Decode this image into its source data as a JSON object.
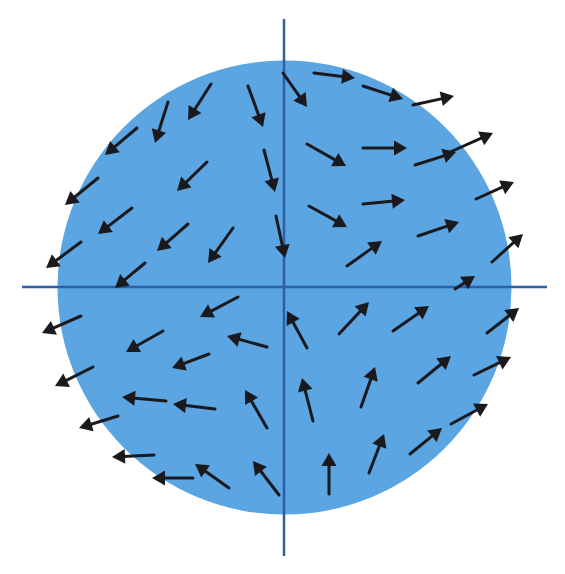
{
  "diagram": {
    "type": "vector-field",
    "colors": {
      "background": "#ffffff",
      "disk_fill": "#5aa5e2",
      "axis": "#2c5fa6",
      "arrow": "#1a1a1e"
    },
    "disk": {
      "cx": 284.5,
      "cy": 287.5,
      "r": 227
    },
    "axes": {
      "horizontal": {
        "x1": 22,
        "y1": 287,
        "x2": 547,
        "y2": 287
      },
      "vertical": {
        "x1": 284,
        "y1": 19,
        "x2": 284,
        "y2": 556
      }
    },
    "arrows": [
      [
        211,
        84,
        188,
        120
      ],
      [
        168,
        102,
        155,
        143
      ],
      [
        137,
        128,
        105,
        155
      ],
      [
        248,
        86,
        263,
        127
      ],
      [
        264,
        150,
        275,
        192
      ],
      [
        207,
        162,
        177,
        191
      ],
      [
        98,
        178,
        65,
        205
      ],
      [
        132,
        208,
        98,
        234
      ],
      [
        188,
        224,
        157,
        251
      ],
      [
        233,
        228,
        208,
        263
      ],
      [
        276,
        216,
        285,
        258
      ],
      [
        81,
        242,
        46,
        268
      ],
      [
        145,
        263,
        115,
        288
      ],
      [
        283,
        73,
        307,
        107
      ],
      [
        314,
        73,
        355,
        78
      ],
      [
        363,
        86,
        403,
        99
      ],
      [
        413,
        105,
        454,
        96
      ],
      [
        307,
        144,
        346,
        166
      ],
      [
        363,
        148,
        407,
        148
      ],
      [
        415,
        165,
        456,
        152
      ],
      [
        448,
        153,
        493,
        133
      ],
      [
        309,
        206,
        347,
        227
      ],
      [
        363,
        204,
        405,
        200
      ],
      [
        476,
        199,
        514,
        182
      ],
      [
        418,
        236,
        459,
        222
      ],
      [
        347,
        266,
        382,
        241
      ],
      [
        492,
        262,
        523,
        234
      ],
      [
        455,
        289,
        475,
        276
      ],
      [
        81,
        316,
        42,
        333
      ],
      [
        238,
        297,
        200,
        317
      ],
      [
        163,
        331,
        126,
        352
      ],
      [
        267,
        347,
        227,
        336
      ],
      [
        209,
        354,
        172,
        368
      ],
      [
        93,
        367,
        55,
        386
      ],
      [
        166,
        401,
        122,
        397
      ],
      [
        215,
        409,
        173,
        404
      ],
      [
        267,
        428,
        245,
        390
      ],
      [
        118,
        416,
        79,
        428
      ],
      [
        154,
        455,
        112,
        457
      ],
      [
        193,
        478,
        152,
        478
      ],
      [
        229,
        488,
        195,
        464
      ],
      [
        279,
        495,
        253,
        461
      ],
      [
        307,
        348,
        287,
        311
      ],
      [
        339,
        334,
        369,
        302
      ],
      [
        393,
        331,
        429,
        306
      ],
      [
        487,
        333,
        519,
        308
      ],
      [
        313,
        421,
        302,
        378
      ],
      [
        361,
        407,
        375,
        367
      ],
      [
        418,
        383,
        451,
        356
      ],
      [
        474,
        375,
        511,
        357
      ],
      [
        451,
        424,
        488,
        404
      ],
      [
        410,
        454,
        442,
        428
      ],
      [
        369,
        473,
        384,
        434
      ],
      [
        329,
        494,
        329,
        453
      ]
    ]
  }
}
